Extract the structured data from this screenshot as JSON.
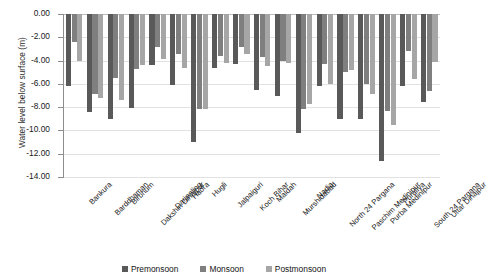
{
  "chart_data": {
    "type": "bar",
    "title": "",
    "xlabel": "",
    "ylabel": "Water level below surface (m)",
    "ylim": [
      -14,
      0
    ],
    "yticks": [
      "0.00",
      "-2.00",
      "-4.00",
      "-6.00",
      "-8.00",
      "-10.00",
      "-12.00",
      "-14.00"
    ],
    "ytick_values": [
      0,
      -2,
      -4,
      -6,
      -8,
      -10,
      -12,
      -14
    ],
    "grid": true,
    "legend_position": "bottom",
    "categories": [
      "Bankura",
      "Barddhaman",
      "Birbhum",
      "Dakshin Dinajpur",
      "Darjeeling",
      "Haora",
      "Hugli",
      "Jalpaiguri",
      "Koch Bihar",
      "Maldah",
      "Murshidabad",
      "Nadia",
      "North 24 Pargana",
      "Paschim Medinipur",
      "Purba Medinipur",
      "Puruliya",
      "South 24 Pargana",
      "Uttar Dinajpur"
    ],
    "series": [
      {
        "name": "Premonsoon",
        "color": "#595959",
        "values": [
          -6.2,
          -8.4,
          -9.0,
          -8.1,
          -4.4,
          -6.1,
          -11.0,
          -4.6,
          -4.3,
          -6.5,
          -7.0,
          -10.2,
          -6.2,
          -9.0,
          -9.0,
          -12.6,
          -6.2,
          -7.6
        ]
      },
      {
        "name": "Monsoon",
        "color": "#7f7f7f",
        "values": [
          -2.4,
          -6.9,
          -5.5,
          -4.7,
          -2.8,
          -3.4,
          -8.2,
          -3.6,
          -2.8,
          -3.7,
          -4.0,
          -8.2,
          -4.3,
          -5.0,
          -6.0,
          -8.3,
          -3.2,
          -6.6
        ]
      },
      {
        "name": "Postmonsoon",
        "color": "#a6a6a6",
        "values": [
          -4.0,
          -7.2,
          -7.4,
          -4.4,
          -3.9,
          -4.6,
          -8.2,
          -4.2,
          -3.4,
          -4.5,
          -4.2,
          -7.7,
          -6.0,
          -4.8,
          -6.9,
          -9.5,
          -5.6,
          -4.1
        ]
      }
    ]
  }
}
